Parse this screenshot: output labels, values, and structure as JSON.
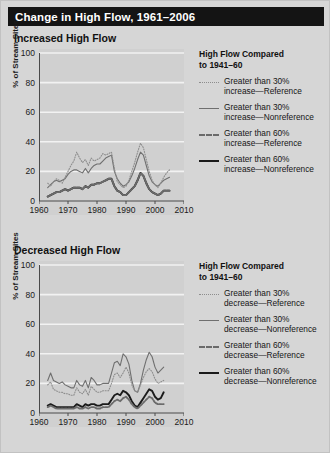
{
  "title": "Change in High Flow, 1961–2006",
  "colors": {
    "banner_bg": "#141414",
    "banner_text": "#ffffff",
    "figure_bg": "#d6d6d6",
    "plot_bg": "#d0d0d0",
    "gridline": "#f2f2f2",
    "axis": "#4a4a4a",
    "reference_30": "#8d8d8d",
    "nonreference_30": "#6f6f6f",
    "reference_60": "#6b6b6b",
    "nonreference_60": "#1b1b1b"
  },
  "panels": {
    "top": {
      "heading": "Increased High Flow",
      "legend": {
        "title_line1": "High Flow Compared",
        "title_line2": "to 1941–60",
        "entries": [
          {
            "style": "sw-dot",
            "line1": "Greater than 30%",
            "line2": "increase—Reference"
          },
          {
            "style": "sw-solid-thin",
            "line1": "Greater than 30%",
            "line2": "increase—Nonreference"
          },
          {
            "style": "sw-dash",
            "line1": "Greater than 60%",
            "line2": "increase—Reference"
          },
          {
            "style": "sw-solid-thick",
            "line1": "Greater than 60%",
            "line2": "increase—Nonreference"
          }
        ]
      }
    },
    "bottom": {
      "heading": "Decreased High Flow",
      "legend": {
        "title_line1": "High Flow Compared",
        "title_line2": "to 1941–60",
        "entries": [
          {
            "style": "sw-dot",
            "line1": "Greater than 30%",
            "line2": "decrease—Reference"
          },
          {
            "style": "sw-solid-thin",
            "line1": "Greater than 30%",
            "line2": "decrease—Nonreference"
          },
          {
            "style": "sw-dash",
            "line1": "Greater than 60%",
            "line2": "decrease—Reference"
          },
          {
            "style": "sw-solid-thick",
            "line1": "Greater than 60%",
            "line2": "decrease—Nonreference"
          }
        ]
      }
    }
  },
  "chart_data": [
    {
      "type": "line",
      "title": "Increased High Flow",
      "xlabel": "",
      "ylabel": "% of Stream Sites",
      "xlim": [
        1960,
        2010
      ],
      "ylim": [
        0,
        100
      ],
      "xticks": [
        1960,
        1970,
        1980,
        1990,
        2000,
        2010
      ],
      "yticks": [
        0,
        20,
        40,
        60,
        80,
        100
      ],
      "grid": "horizontal",
      "legend_position": "right",
      "x": [
        1963,
        1964,
        1965,
        1966,
        1967,
        1968,
        1969,
        1970,
        1971,
        1972,
        1973,
        1974,
        1975,
        1976,
        1977,
        1978,
        1979,
        1980,
        1981,
        1982,
        1983,
        1984,
        1985,
        1986,
        1987,
        1988,
        1989,
        1990,
        1991,
        1992,
        1993,
        1994,
        1995,
        1996,
        1997,
        1998,
        1999,
        2000,
        2001,
        2002,
        2003,
        2004,
        2005
      ],
      "series": [
        {
          "name": "Greater than 30% increase—Reference",
          "style": "dotted",
          "values": [
            12,
            10,
            13,
            15,
            14,
            12,
            16,
            20,
            24,
            27,
            33,
            29,
            26,
            28,
            24,
            29,
            27,
            28,
            29,
            32,
            31,
            32,
            33,
            22,
            13,
            11,
            9,
            10,
            14,
            20,
            26,
            33,
            39,
            36,
            28,
            20,
            14,
            11,
            9,
            12,
            16,
            19,
            21
          ]
        },
        {
          "name": "Greater than 30% increase—Nonreference",
          "style": "solid-thin",
          "values": [
            9,
            11,
            13,
            14,
            13,
            14,
            15,
            18,
            20,
            21,
            21,
            20,
            19,
            22,
            19,
            22,
            24,
            25,
            25,
            27,
            29,
            30,
            31,
            20,
            15,
            12,
            10,
            11,
            13,
            17,
            22,
            28,
            33,
            31,
            24,
            17,
            13,
            11,
            10,
            12,
            14,
            15,
            16
          ]
        },
        {
          "name": "Greater than 60% increase—Reference",
          "style": "dashed",
          "values": [
            3,
            4,
            5,
            6,
            6,
            7,
            8,
            7,
            8,
            9,
            9,
            9,
            8,
            10,
            9,
            11,
            11,
            12,
            12,
            13,
            14,
            15,
            15,
            10,
            7,
            6,
            4,
            4,
            6,
            8,
            10,
            14,
            19,
            17,
            12,
            8,
            6,
            5,
            4,
            5,
            7,
            7,
            7
          ]
        },
        {
          "name": "Greater than 60% increase—Nonreference",
          "style": "solid-thick",
          "values": [
            3,
            4,
            5,
            6,
            6,
            7,
            8,
            7,
            8,
            9,
            9,
            9,
            8,
            10,
            9,
            11,
            11,
            12,
            12,
            13,
            14,
            15,
            15,
            10,
            7,
            6,
            4,
            4,
            6,
            8,
            10,
            14,
            19,
            17,
            12,
            8,
            6,
            5,
            4,
            5,
            7,
            7,
            7
          ]
        }
      ]
    },
    {
      "type": "line",
      "title": "Decreased High Flow",
      "xlabel": "",
      "ylabel": "% of Stream Sites",
      "xlim": [
        1960,
        2010
      ],
      "ylim": [
        0,
        100
      ],
      "xticks": [
        1960,
        1970,
        1980,
        1990,
        2000,
        2010
      ],
      "yticks": [
        0,
        20,
        40,
        60,
        80,
        100
      ],
      "grid": "horizontal",
      "legend_position": "right",
      "x": [
        1963,
        1964,
        1965,
        1966,
        1967,
        1968,
        1969,
        1970,
        1971,
        1972,
        1973,
        1974,
        1975,
        1976,
        1977,
        1978,
        1979,
        1980,
        1981,
        1982,
        1983,
        1984,
        1985,
        1986,
        1987,
        1988,
        1989,
        1990,
        1991,
        1992,
        1993,
        1994,
        1995,
        1996,
        1997,
        1998,
        1999,
        2000,
        2001,
        2002,
        2003,
        2004,
        2005
      ],
      "series": [
        {
          "name": "Greater than 30% decrease—Reference",
          "style": "dotted",
          "values": [
            19,
            21,
            16,
            15,
            14,
            14,
            13,
            13,
            12,
            12,
            17,
            14,
            13,
            16,
            12,
            18,
            16,
            14,
            14,
            15,
            15,
            15,
            20,
            26,
            27,
            24,
            27,
            31,
            27,
            19,
            15,
            14,
            19,
            24,
            28,
            30,
            28,
            23,
            20,
            21,
            22
          ]
        },
        {
          "name": "Greater than 30% decrease—Nonreference",
          "style": "solid-thin",
          "values": [
            22,
            27,
            22,
            21,
            20,
            21,
            19,
            18,
            17,
            17,
            22,
            19,
            18,
            22,
            17,
            24,
            22,
            19,
            19,
            20,
            20,
            20,
            27,
            34,
            35,
            32,
            40,
            38,
            33,
            22,
            15,
            14,
            20,
            29,
            36,
            41,
            38,
            31,
            27,
            29,
            31
          ]
        },
        {
          "name": "Greater than 60% decrease—Reference",
          "style": "dashed",
          "values": [
            4,
            5,
            4,
            3,
            3,
            3,
            3,
            3,
            3,
            3,
            4,
            3,
            3,
            4,
            3,
            4,
            4,
            3,
            3,
            4,
            4,
            4,
            6,
            8,
            9,
            8,
            10,
            11,
            9,
            6,
            4,
            3,
            5,
            7,
            9,
            11,
            10,
            7,
            6,
            6,
            6
          ]
        },
        {
          "name": "Greater than 60% decrease—Nonreference",
          "style": "solid-thick",
          "values": [
            5,
            6,
            5,
            4,
            4,
            4,
            4,
            4,
            4,
            4,
            6,
            5,
            4,
            6,
            5,
            6,
            6,
            5,
            5,
            6,
            6,
            6,
            9,
            12,
            13,
            12,
            15,
            14,
            12,
            8,
            5,
            4,
            7,
            10,
            13,
            16,
            15,
            11,
            9,
            10,
            14
          ]
        }
      ]
    }
  ]
}
